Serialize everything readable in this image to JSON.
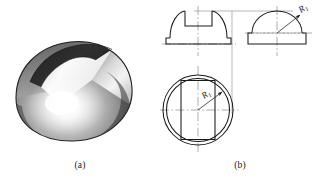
{
  "figure": {
    "background_color": "#ffffff",
    "line_color": "#1a1a1a",
    "centerline_color": "#8a8a8a",
    "projection_line_color": "#9a9a9a",
    "panels": [
      {
        "id": "pictorial",
        "caption": "(a)",
        "description": "shaded hemispherical dome with a rectangular slot cut across the top",
        "object_name": "slotted-dome-solid"
      },
      {
        "id": "orthographic",
        "caption": "(b)",
        "description": "three-view orthographic projection of the slotted dome",
        "views": [
          {
            "id": "front-view",
            "name": "front-view",
            "label": "",
            "features": [
              "dome-profile-arc",
              "slot-notch",
              "base-flange",
              "vertical-centerline",
              "horizontal-centerline"
            ]
          },
          {
            "id": "side-view",
            "name": "side-view",
            "label": "",
            "features": [
              "dome-profile-arc",
              "base-flange",
              "vertical-centerline",
              "horizontal-centerline",
              "radius-leader"
            ]
          },
          {
            "id": "top-view",
            "name": "top-view",
            "label": "",
            "features": [
              "outer-circle",
              "inner-circle",
              "slot-rectangle",
              "vertical-centerline",
              "horizontal-centerline",
              "radius-leader"
            ]
          }
        ]
      }
    ]
  },
  "dimensions": [
    {
      "id": "radius-side-view",
      "name": "radius-dimension-side-view",
      "symbol": "R",
      "subscript": "1",
      "text": "R1",
      "view": "side-view",
      "rotation_deg": -35
    },
    {
      "id": "radius-top-view",
      "name": "radius-dimension-top-view",
      "symbol": "R",
      "subscript": "1",
      "text": "R1",
      "view": "top-view",
      "rotation_deg": -35
    }
  ],
  "shading": {
    "type": "grayscale",
    "highlight_color": "#fdfdfd",
    "midtone_color": "#9b9b9b",
    "shadow_color": "#3a3a3a",
    "slot_interior_color": "#2b2b2b",
    "slot_floor_color": "#efefef",
    "outline_color": "#2a2a2a"
  }
}
